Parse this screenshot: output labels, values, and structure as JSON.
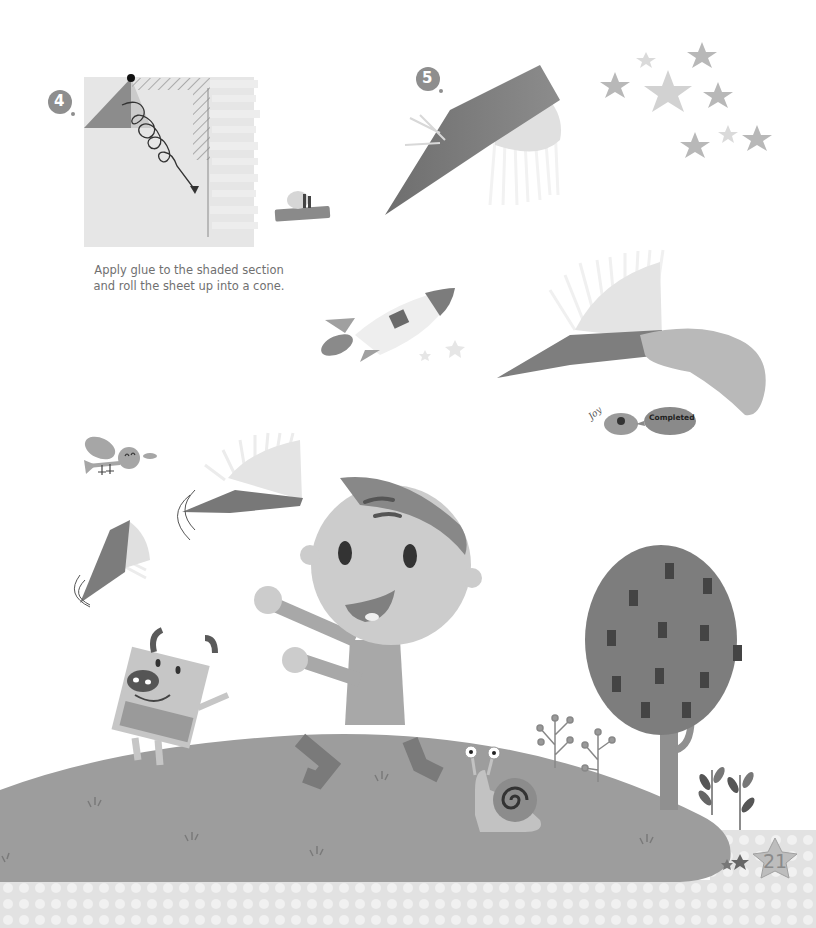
{
  "page": {
    "type": "children-craft-book-page",
    "page_number": "21"
  },
  "steps": [
    {
      "number": "4",
      "caption_line1": "Apply glue to the shaded section",
      "caption_line2": "and roll the sheet up into a cone."
    },
    {
      "number": "5"
    }
  ],
  "badge": {
    "joy_label": "Joy",
    "status_label": "Completed"
  },
  "colors": {
    "background": "#ffffff",
    "hill": "#9d9d9d",
    "footer": "#e2e2e2",
    "footer_dots": "#f0f0f0",
    "dark_accent": "#6a6a6a",
    "text": "#707070"
  }
}
